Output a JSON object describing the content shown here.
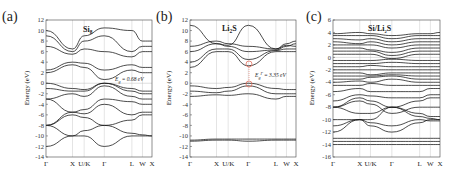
{
  "chart_data": [
    {
      "type": "line",
      "panel": "(a)",
      "title": "Si8",
      "xlabel": "",
      "ylabel": "Energy (eV)",
      "ylim": [
        -14,
        12
      ],
      "yticks": [
        12,
        10,
        8,
        6,
        4,
        2,
        0,
        -2,
        -4,
        -6,
        -8,
        -10,
        -12,
        -14
      ],
      "kpoints": [
        "Γ",
        "X",
        "U/K",
        "Γ",
        "L",
        "W",
        "X"
      ],
      "kpos": [
        0,
        0.25,
        0.36,
        0.55,
        0.81,
        0.91,
        1.0
      ],
      "annotation": "Eg = 0.68 eV",
      "series": [
        {
          "name": "band1",
          "values": [
            -12,
            -10,
            -10,
            -12,
            -10,
            -10,
            -10
          ]
        },
        {
          "name": "band2",
          "values": [
            -8,
            -10,
            -9,
            -8,
            -9.5,
            -9.8,
            -10
          ]
        },
        {
          "name": "band3",
          "values": [
            -8,
            -6,
            -6.5,
            -8,
            -7,
            -6,
            -6
          ]
        },
        {
          "name": "band4",
          "values": [
            -8,
            -5.5,
            -5.8,
            -4,
            -6,
            -5.5,
            -5.5
          ]
        },
        {
          "name": "band5",
          "values": [
            -3,
            -5.5,
            -5,
            -3,
            -3.5,
            -4,
            -4
          ]
        },
        {
          "name": "band6",
          "values": [
            -3,
            -2,
            -2.5,
            -0.5,
            -2.5,
            -3,
            -3
          ]
        },
        {
          "name": "band7",
          "values": [
            -1,
            -1.5,
            -1.5,
            0,
            -1.5,
            -2,
            -2
          ]
        },
        {
          "name": "band8",
          "values": [
            0,
            -1,
            -1.2,
            0,
            -1,
            -1.5,
            -1.5
          ]
        },
        {
          "name": "band9",
          "values": [
            2,
            3.5,
            3,
            0.7,
            2.5,
            2,
            2
          ]
        },
        {
          "name": "band10",
          "values": [
            2.5,
            4,
            3.8,
            2.5,
            3.5,
            3,
            3
          ]
        },
        {
          "name": "band11",
          "values": [
            7,
            5.5,
            6.5,
            6,
            5,
            6,
            6
          ]
        },
        {
          "name": "band12",
          "values": [
            9,
            6,
            8,
            9,
            6,
            7,
            7
          ]
        },
        {
          "name": "band13",
          "values": [
            10,
            6.5,
            9,
            10.5,
            10,
            8,
            8
          ]
        }
      ]
    },
    {
      "type": "line",
      "panel": "(b)",
      "title": "Li2S",
      "xlabel": "",
      "ylabel": "Energy (eV)",
      "ylim": [
        -14,
        12
      ],
      "yticks": [
        12,
        10,
        8,
        6,
        4,
        2,
        0,
        -2,
        -4,
        -6,
        -8,
        -10,
        -12,
        -14
      ],
      "kpoints": [
        "Γ",
        "X",
        "U/K",
        "Γ",
        "L",
        "W",
        "X"
      ],
      "kpos": [
        0,
        0.25,
        0.36,
        0.55,
        0.81,
        0.91,
        1.0
      ],
      "annotation": "Eg = 3.35 eV",
      "series": [
        {
          "name": "band1",
          "values": [
            -11,
            -10.8,
            -10.8,
            -11,
            -10.8,
            -10.8,
            -10.8
          ]
        },
        {
          "name": "band2",
          "values": [
            -10.8,
            -10.6,
            -10.6,
            -10.6,
            -10.6,
            -10.6,
            -10.6
          ]
        },
        {
          "name": "band3",
          "values": [
            -2.5,
            -2.2,
            -2.3,
            -2,
            -3,
            -2.5,
            -2.5
          ]
        },
        {
          "name": "band4",
          "values": [
            -1.5,
            -1.8,
            -1.5,
            -0.5,
            -2,
            -2,
            -2
          ]
        },
        {
          "name": "band5",
          "values": [
            -0.5,
            -1,
            -0.8,
            0,
            -1,
            -1.2,
            -1.2
          ]
        },
        {
          "name": "band6",
          "values": [
            3,
            6,
            6,
            3.3,
            6,
            6,
            6
          ]
        },
        {
          "name": "band7",
          "values": [
            4,
            6.5,
            6.5,
            4.5,
            6.2,
            6.5,
            6.5
          ]
        },
        {
          "name": "band8",
          "values": [
            6,
            7.5,
            7,
            6,
            6.3,
            7,
            7.5
          ]
        },
        {
          "name": "band9",
          "values": [
            7,
            8,
            7.5,
            7,
            6.5,
            7.5,
            8
          ]
        },
        {
          "name": "band10",
          "values": [
            11,
            7.5,
            7.2,
            11,
            6.5,
            7.2,
            7
          ]
        }
      ]
    },
    {
      "type": "line",
      "panel": "(c)",
      "title": "Si/Li2S",
      "xlabel": "",
      "ylabel": "Energy (eV)",
      "ylim": [
        -16,
        6
      ],
      "yticks": [
        6,
        4,
        2,
        0,
        -2,
        -4,
        -6,
        -8,
        -10,
        -12,
        -14,
        -16
      ],
      "kpoints": [
        "Γ",
        "X",
        "U/K",
        "Γ",
        "L",
        "W",
        "X"
      ],
      "kpos": [
        0,
        0.25,
        0.35,
        0.55,
        0.81,
        0.91,
        1.0
      ],
      "series": [
        {
          "name": "flat1",
          "values": [
            -14,
            -14,
            -14,
            -14,
            -14,
            -14,
            -14
          ]
        },
        {
          "name": "flat2",
          "values": [
            -13.5,
            -13.5,
            -13.5,
            -13.5,
            -13.5,
            -13.5,
            -13.5
          ]
        },
        {
          "name": "flat3",
          "values": [
            -13,
            -13,
            -13,
            -13,
            -13,
            -13,
            -13
          ]
        },
        {
          "name": "b1",
          "values": [
            -12,
            -10,
            -11,
            -12,
            -10.5,
            -10,
            -10
          ]
        },
        {
          "name": "b2",
          "values": [
            -11,
            -10,
            -10.5,
            -11,
            -10,
            -10.2,
            -10.2
          ]
        },
        {
          "name": "b3",
          "values": [
            -10,
            -10,
            -10,
            -8,
            -9.5,
            -9.8,
            -10
          ]
        },
        {
          "name": "b4",
          "values": [
            -8,
            -9,
            -9,
            -8,
            -9,
            -9.5,
            -9.5
          ]
        },
        {
          "name": "b5",
          "values": [
            -8,
            -7,
            -7.5,
            -9,
            -8,
            -8,
            -8
          ]
        },
        {
          "name": "b6",
          "values": [
            -8,
            -6.5,
            -7,
            -8,
            -7,
            -6.5,
            -6.5
          ]
        },
        {
          "name": "b7",
          "values": [
            -7,
            -6,
            -6.2,
            -6.5,
            -6.5,
            -6,
            -6
          ]
        },
        {
          "name": "b8",
          "values": [
            -5.5,
            -5,
            -5.5,
            -5.5,
            -5.5,
            -5,
            -5
          ]
        },
        {
          "name": "b9",
          "values": [
            -4.5,
            -4.5,
            -4.2,
            -4.5,
            -4.5,
            -4.5,
            -4.5
          ]
        },
        {
          "name": "b10",
          "values": [
            -4,
            -3.8,
            -4,
            -3.5,
            -4,
            -4,
            -4
          ]
        },
        {
          "name": "b11",
          "values": [
            -3.5,
            -3.5,
            -3.2,
            -3,
            -3.5,
            -3.5,
            -3.5
          ]
        },
        {
          "name": "b12",
          "values": [
            -3,
            -3,
            -3,
            -2.8,
            -3,
            -3,
            -3
          ]
        },
        {
          "name": "b13",
          "values": [
            -2.5,
            -2.5,
            -2.8,
            -2.5,
            -2.5,
            -2.5,
            -2.5
          ]
        },
        {
          "name": "b14",
          "values": [
            -2,
            -2,
            -2,
            -2,
            -2,
            -2,
            -2
          ]
        },
        {
          "name": "b15",
          "values": [
            -1.5,
            -1.5,
            -1.3,
            -1.5,
            -1.5,
            -1.5,
            -1.5
          ]
        },
        {
          "name": "b16",
          "values": [
            -1,
            -1,
            -1,
            -0.8,
            -1,
            -1,
            -1
          ]
        },
        {
          "name": "b17",
          "values": [
            -0.5,
            -0.5,
            -0.5,
            -0.3,
            -0.5,
            -0.5,
            -0.5
          ]
        },
        {
          "name": "b18",
          "values": [
            0.5,
            0.5,
            0.5,
            -0.2,
            0.5,
            0.5,
            0.5
          ]
        },
        {
          "name": "b19",
          "values": [
            1,
            1,
            1,
            0.3,
            1,
            1,
            1
          ]
        },
        {
          "name": "b20",
          "values": [
            1.5,
            1.5,
            1.2,
            0.8,
            1.5,
            1.5,
            1.5
          ]
        },
        {
          "name": "b21",
          "values": [
            2,
            2,
            2,
            1.5,
            2,
            2,
            2
          ]
        },
        {
          "name": "b22",
          "values": [
            2.5,
            2.2,
            2.5,
            2,
            2.5,
            2.5,
            2.5
          ]
        },
        {
          "name": "b23",
          "values": [
            3,
            2.8,
            3,
            2.5,
            3,
            3,
            3
          ]
        },
        {
          "name": "b24",
          "values": [
            3.5,
            3.5,
            3.5,
            3,
            3.5,
            3.5,
            3.5
          ]
        },
        {
          "name": "b25",
          "values": [
            3.8,
            4,
            3.8,
            3.5,
            3.8,
            3.8,
            4
          ]
        }
      ]
    }
  ],
  "panels": [
    {
      "letter": "(a)",
      "title_main": "Si",
      "title_sub": "8",
      "ylabel": "Energy (eV)",
      "annotation": "E",
      "annotation_sub": "g",
      "annotation_sup": "",
      "annotation_value": " = 0.68 eV"
    },
    {
      "letter": "(b)",
      "title_main": "Li",
      "title_sub": "2",
      "title_tail": "S",
      "ylabel": "Energy (eV)",
      "annotation": "E",
      "annotation_sub": "g",
      "annotation_sup": "Γ",
      "annotation_value": " = 3.35 eV"
    },
    {
      "letter": "(c)",
      "title_main": "Si/Li",
      "title_sub": "2",
      "title_tail": "S",
      "ylabel": "Energy (eV)"
    }
  ],
  "colors": {
    "band": "#111111",
    "highlight": "#e07060",
    "grid": "#c8c8c8"
  }
}
